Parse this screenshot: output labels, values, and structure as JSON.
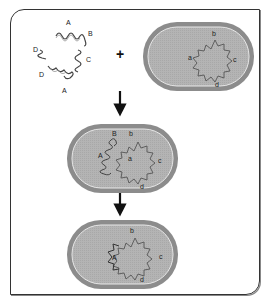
{
  "diagram": {
    "type": "bacterial transformation / homologous recombination",
    "colors": {
      "cell_wall": "#8c8c8c",
      "cell_inner_line": "#e6e6e6",
      "cytoplasm": "#b4b4b4",
      "dna": "#444444",
      "frame": "#333333",
      "arrow": "#111111"
    },
    "symbols": {
      "plus": "+",
      "arrow": "down-arrow"
    },
    "free_dna": {
      "fragments": [
        "A",
        "B",
        "C",
        "D",
        "D",
        "A"
      ]
    },
    "steps": [
      {
        "name": "recipient-cell",
        "labels": {
          "a": "a",
          "b": "b",
          "c": "c",
          "d": "d"
        }
      },
      {
        "name": "donor-dna-entering",
        "donor_labels": {
          "A": "A",
          "B": "B"
        },
        "labels": {
          "a": "a",
          "b": "b",
          "c": "c",
          "d": "d"
        }
      },
      {
        "name": "recombinant-cell",
        "labels": {
          "A": "A",
          "b": "b",
          "c": "c",
          "d": "d"
        }
      }
    ]
  }
}
